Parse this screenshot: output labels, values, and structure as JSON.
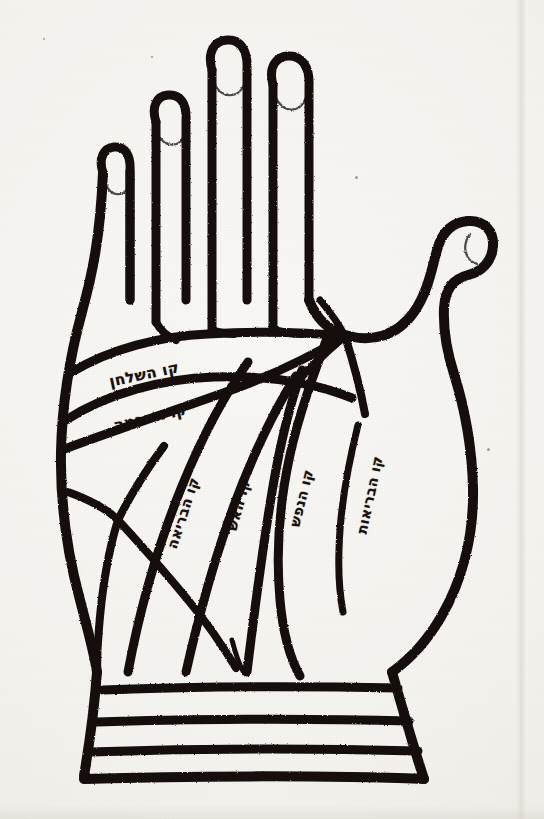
{
  "document": {
    "kind": "printed-illustration",
    "subject": "palmistry-hand-diagram",
    "script": "hebrew",
    "paper_color": "#f4f2ee",
    "ink_color": "#14110e"
  },
  "figure": {
    "name": "left-hand-palm-diagram",
    "hand": {
      "digits": [
        {
          "name": "little-finger",
          "order": 1
        },
        {
          "name": "ring-finger",
          "order": 2
        },
        {
          "name": "middle-finger",
          "order": 3
        },
        {
          "name": "index-finger",
          "order": 4
        },
        {
          "name": "thumb",
          "order": 5
        }
      ],
      "fingernails": 5,
      "wrist_bracelet_lines": 3
    },
    "labels": [
      {
        "id": "line-of-the-table",
        "hebrew": "קו השלחן",
        "transliteration": "qav ha-shulchan",
        "translation": "line of the table",
        "orientation": "horizontal-slanted"
      },
      {
        "id": "line-of-wisdom",
        "hebrew": "קו החכמה",
        "transliteration": "qav ha-chochmah",
        "translation": "line of wisdom",
        "orientation": "horizontal-slanted"
      },
      {
        "id": "line-of-life",
        "hebrew": "קו הבריאה",
        "transliteration": "qav ha-beriah",
        "translation": "line of creation / life",
        "orientation": "vertical"
      },
      {
        "id": "line-of-fire",
        "hebrew": "קו האש",
        "transliteration": "qav ha-esh",
        "translation": "line of fire",
        "orientation": "vertical"
      },
      {
        "id": "line-of-the-soul",
        "hebrew": "קו הנפש",
        "transliteration": "qav ha-nefesh",
        "translation": "line of the soul",
        "orientation": "vertical"
      },
      {
        "id": "line-of-health",
        "hebrew": "קו הבריאות",
        "transliteration": "qav ha-bri'ut",
        "translation": "line of health",
        "orientation": "vertical"
      }
    ]
  }
}
